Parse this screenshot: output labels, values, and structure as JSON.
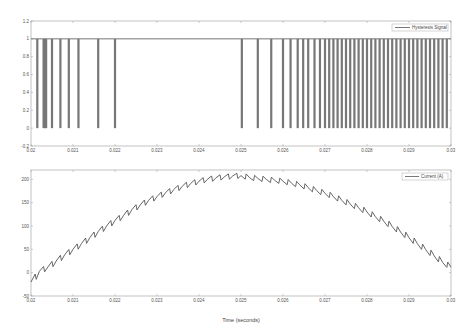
{
  "chart_data": [
    {
      "type": "line",
      "title": "",
      "xlabel": "",
      "ylabel": "",
      "legend": [
        "Hysteresis Signal"
      ],
      "legend_position": "upper right",
      "xlim": [
        0.02,
        0.03
      ],
      "ylim": [
        -0.2,
        1.2
      ],
      "xticks": [
        "0.02",
        "0.021",
        "0.022",
        "0.023",
        "0.024",
        "0.025",
        "0.026",
        "0.027",
        "0.028",
        "0.029",
        "0.03"
      ],
      "yticks": [
        "-0.2",
        "0",
        "0.2",
        "0.4",
        "0.6",
        "0.8",
        "1",
        "1.2"
      ],
      "grid": false,
      "series": [
        {
          "name": "Hysteresis Signal",
          "description": "Binary switching signal (0/1); high most of the time with brief drops to 0. Drop times (s) approximate:",
          "low_pulse_times": [
            0.02015,
            0.0203,
            0.02033,
            0.02036,
            0.0205,
            0.0207,
            0.0209,
            0.02113,
            0.0216,
            0.022,
            0.02502,
            0.0254,
            0.02572,
            0.026,
            0.02618,
            0.02635,
            0.02648,
            0.0266,
            0.02675,
            0.02688,
            0.027,
            0.0271,
            0.0272,
            0.0273,
            0.0274,
            0.0275,
            0.0276,
            0.0277,
            0.0278,
            0.0279,
            0.028,
            0.0281,
            0.0282,
            0.0283,
            0.0284,
            0.0285,
            0.0286,
            0.0287,
            0.0288,
            0.0289,
            0.029,
            0.0291,
            0.0292,
            0.0293,
            0.0294,
            0.0295,
            0.0296,
            0.0297,
            0.0298,
            0.0299
          ]
        }
      ]
    },
    {
      "type": "line",
      "title": "",
      "xlabel": "Time (seconds)",
      "ylabel": "",
      "legend": [
        "Current (A)"
      ],
      "legend_position": "upper right",
      "xlim": [
        0.02,
        0.03
      ],
      "ylim": [
        -50,
        220
      ],
      "xticks": [
        "0.02",
        "0.021",
        "0.022",
        "0.023",
        "0.024",
        "0.025",
        "0.026",
        "0.027",
        "0.028",
        "0.029",
        "0.03"
      ],
      "yticks": [
        "-50",
        "0",
        "50",
        "100",
        "150",
        "200"
      ],
      "grid": false,
      "series": [
        {
          "name": "Current (A)",
          "x": [
            0.02,
            0.0202,
            0.0204,
            0.0206,
            0.0208,
            0.021,
            0.0212,
            0.0214,
            0.0216,
            0.0218,
            0.022,
            0.0222,
            0.0224,
            0.0226,
            0.0228,
            0.023,
            0.0232,
            0.0234,
            0.0236,
            0.0238,
            0.024,
            0.0242,
            0.0244,
            0.0246,
            0.0248,
            0.025,
            0.0252,
            0.0254,
            0.0256,
            0.0258,
            0.026,
            0.0262,
            0.0264,
            0.0266,
            0.0268,
            0.027,
            0.0272,
            0.0274,
            0.0276,
            0.0278,
            0.028,
            0.0282,
            0.0284,
            0.0286,
            0.0288,
            0.029,
            0.0292,
            0.0294,
            0.0296,
            0.0298,
            0.03
          ],
          "y": [
            -20,
            3,
            12,
            25,
            38,
            50,
            62,
            75,
            88,
            100,
            112,
            122,
            135,
            145,
            155,
            163,
            171,
            178,
            185,
            191,
            196,
            200,
            203,
            205,
            207,
            208,
            204,
            202,
            200,
            198,
            196,
            192,
            188,
            182,
            176,
            170,
            163,
            155,
            147,
            139,
            130,
            120,
            110,
            99,
            87,
            75,
            62,
            49,
            36,
            22,
            12
          ]
        }
      ]
    }
  ],
  "top_plot": {
    "legend_label": "Hysteresis Signal",
    "yticks": [
      "1.2",
      "1",
      "0.8",
      "0.6",
      "0.4",
      "0.2",
      "0",
      "-0.2"
    ],
    "xticks": [
      "0.02",
      "0.021",
      "0.022",
      "0.023",
      "0.024",
      "0.025",
      "0.026",
      "0.027",
      "0.028",
      "0.029",
      "0.03"
    ]
  },
  "bottom_plot": {
    "legend_label": "Current (A)",
    "yticks": [
      "200",
      "150",
      "100",
      "50",
      "0",
      "-50"
    ],
    "xticks": [
      "0.02",
      "0.021",
      "0.022",
      "0.023",
      "0.024",
      "0.025",
      "0.026",
      "0.027",
      "0.028",
      "0.029",
      "0.03"
    ],
    "xlabel": "Time (seconds)"
  },
  "colors": {
    "line": "#555555",
    "axis": "#999999",
    "background": "#ffffff"
  }
}
